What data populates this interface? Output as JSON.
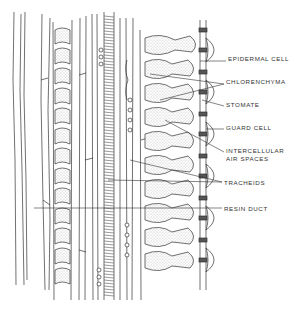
{
  "diagram": {
    "labels": [
      {
        "id": "epidermal-cell",
        "text": "EPIDERMAL CELL",
        "x": 228,
        "y": 58
      },
      {
        "id": "chlorenchyma",
        "text": "CHLORENCHYMA",
        "x": 226,
        "y": 81
      },
      {
        "id": "stomate",
        "text": "STOMATE",
        "x": 226,
        "y": 103
      },
      {
        "id": "guard-cell",
        "text": "GUARD CELL",
        "x": 226,
        "y": 126
      },
      {
        "id": "intercellular-air-spaces-1",
        "text": "INTERCELLULAR",
        "x": 226,
        "y": 148
      },
      {
        "id": "intercellular-air-spaces-2",
        "text": "AIR SPACES",
        "x": 226,
        "y": 156
      },
      {
        "id": "tracheids",
        "text": "TRACHEIDS",
        "x": 224,
        "y": 179
      },
      {
        "id": "resin-duct",
        "text": "RESIN DUCT",
        "x": 224,
        "y": 205
      }
    ],
    "colors": {
      "ink": "#333333",
      "background": "#ffffff",
      "stipple": "#9a9a9a"
    }
  }
}
